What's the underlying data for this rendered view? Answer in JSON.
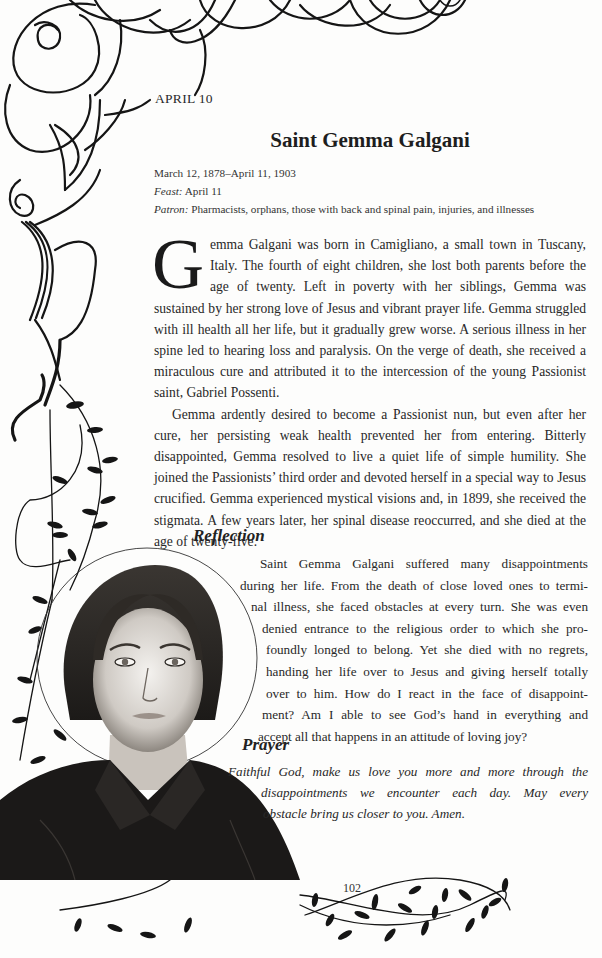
{
  "header": {
    "date_label": "APRIL 10"
  },
  "saint": {
    "name": "Saint Gemma Galgani",
    "life_dates": "March 12, 1878–April 11, 1903",
    "feast_label": "Feast:",
    "feast_value": "April 11",
    "patron_label": "Patron:",
    "patron_value": "Pharmacists, orphans, those with back and spinal pain, injuries, and illnesses"
  },
  "biography": {
    "drop_cap": "G",
    "paragraph_1_rest": "emma Galgani was born in Camigliano, a small town in Tuscany, Italy. The fourth of eight children, she lost both parents before the age of twenty. Left in poverty with her siblings, Gemma was sustained by her strong love of Jesus and vibrant prayer life. Gemma struggled with ill health all her life, but it gradually grew worse. A serious illness in her spine led to hearing loss and paralysis. On the verge of death, she received a miraculous cure and attributed it to the intercession of the young Passionist saint, Gabriel Possenti.",
    "paragraph_2": "Gemma ardently desired to become a Passionist nun, but even after her cure, her persisting weak health prevented her from entering. Bitterly disappointed, Gemma resolved to live a quiet life of simple humility. She joined the Passionists’ third order and devoted herself in a special way to Jesus crucified. Gemma experienced mystical visions and, in 1899, she received the stigmata. A few years later, her spinal disease reoccurred, and she died at the age of twenty-five."
  },
  "reflection": {
    "heading": "Reflection",
    "lines": [
      "Saint Gemma Galgani suffered many disappointments",
      "during her life. From the death of close loved ones to termi-",
      "nal illness, she faced obstacles at every turn. She was even",
      "denied entrance to the religious order to which she pro-",
      "foundly longed to belong. Yet she died with no regrets,",
      "handing her life over to Jesus and giving herself totally",
      "over to him. How do I react in the face of disappoint-",
      "ment? Am I able to see God’s hand in everything and",
      "accept all that happens in an attitude of loving joy?"
    ]
  },
  "prayer": {
    "heading": "Prayer",
    "lines": [
      "Faithful God, make us love you more and more through the",
      "disappointments we encounter each day. May every",
      "obstacle bring us closer to you. Amen."
    ]
  },
  "footer": {
    "page_number": "102"
  },
  "illustration": {
    "subject": "portrait of Saint Gemma Galgani with halo",
    "ornaments": [
      "cloud-scroll-border",
      "leafy-vine-border"
    ]
  },
  "colors": {
    "paper": "#fdfdfc",
    "ink": "#1e1e1e"
  }
}
